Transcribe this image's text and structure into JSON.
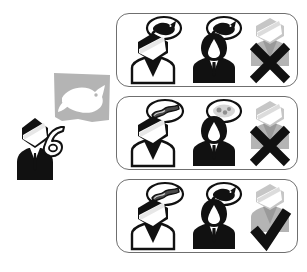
{
  "figure": {
    "kind": "pictogram-diagram",
    "background_color": "#ffffff",
    "ink_color": "#111111",
    "gray_color": "#b4b4b4",
    "gray_dark_color": "#9a9a9a",
    "border_color": "#6f6f6f"
  },
  "demo": {
    "label": "demonstration-scene",
    "display_panel": {
      "name": "gray-display-panel",
      "content_icon": "fish-icon",
      "content_label": "fish",
      "panel_color": "#b4b4b4",
      "icon_color": "#ffffff"
    },
    "person": {
      "name": "pointing-person",
      "label": "instructor",
      "gesture_icon": "pointing-hand-icon",
      "gesture_label": "pointing at display",
      "attire": "suit-and-tie",
      "body_color": "#111111",
      "face_color": "#ffffff"
    }
  },
  "panels": [
    {
      "id": "panel-1",
      "index": 1,
      "speaker": {
        "name": "speaker-figure",
        "label": "speaker",
        "style": "light-shirt-dark-hair",
        "bubble": {
          "name": "speech-bubble",
          "icon": "fish-icon",
          "content_label": "fish",
          "icon_color": "#111111",
          "tail": "left-down"
        }
      },
      "listener": {
        "name": "listener-figure",
        "label": "listener",
        "style": "dark-silhouette",
        "bubble": {
          "name": "speech-bubble",
          "icon": "fish-icon",
          "content_label": "fish",
          "icon_color": "#111111",
          "tail": "left-down"
        }
      },
      "verdict": {
        "name": "verdict-cross",
        "mark": "cross-icon",
        "mark_label": "incorrect",
        "mark_color": "#111111",
        "figure_color": "#b4b4b4"
      }
    },
    {
      "id": "panel-2",
      "index": 2,
      "speaker": {
        "name": "speaker-figure",
        "label": "speaker",
        "style": "light-shirt-dark-hair",
        "bubble": {
          "name": "speech-bubble",
          "icon": "bacon-strip-icon",
          "content_label": "bacon strip",
          "icon_color": "#4a4a4a",
          "tail": "left-down"
        }
      },
      "listener": {
        "name": "listener-figure",
        "label": "listener",
        "style": "dark-silhouette",
        "bubble": {
          "name": "speech-bubble",
          "icon": "confusion-blob-icon",
          "content_label": "unclear blob",
          "icon_color": "#bdbdbd",
          "tail": "left-down"
        }
      },
      "verdict": {
        "name": "verdict-cross",
        "mark": "cross-icon",
        "mark_label": "incorrect",
        "mark_color": "#111111",
        "figure_color": "#b4b4b4"
      }
    },
    {
      "id": "panel-3",
      "index": 3,
      "speaker": {
        "name": "speaker-figure",
        "label": "speaker",
        "style": "light-shirt-dark-hair",
        "bubble": {
          "name": "speech-bubble",
          "icon": "bacon-strip-icon",
          "content_label": "bacon strip",
          "icon_color": "#4a4a4a",
          "tail": "left-down"
        }
      },
      "listener": {
        "name": "listener-figure",
        "label": "listener",
        "style": "dark-silhouette",
        "bubble": {
          "name": "speech-bubble",
          "icon": "fish-icon",
          "content_label": "fish",
          "icon_color": "#111111",
          "tail": "left-down"
        }
      },
      "verdict": {
        "name": "verdict-check",
        "mark": "check-icon",
        "mark_label": "correct",
        "mark_color": "#111111",
        "figure_color": "#b4b4b4"
      }
    }
  ]
}
